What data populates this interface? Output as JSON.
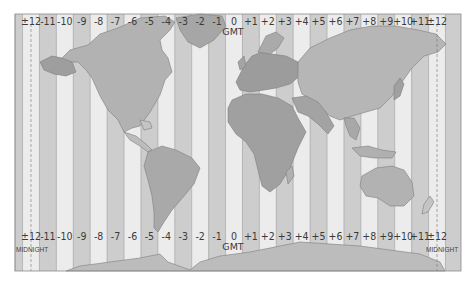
{
  "map": {
    "title": "World Time Zones",
    "zones_top": [
      "±12",
      "-11",
      "-10",
      "-9",
      "-8",
      "-7",
      "-6",
      "-5",
      "-4",
      "-3",
      "-2",
      "-1",
      "0",
      "+1",
      "+2",
      "+3",
      "+4",
      "+5",
      "+6",
      "+7",
      "+8",
      "+9",
      "+10",
      "+11",
      "±12"
    ],
    "zones_bottom": [
      "±12",
      "-11",
      "-10",
      "-9",
      "-8",
      "-7",
      "-6",
      "-5",
      "-4",
      "-3",
      "-2",
      "-1",
      "0",
      "+1",
      "+2",
      "+3",
      "+4",
      "+5",
      "+6",
      "+7",
      "+8",
      "+9",
      "+10",
      "+11",
      "±12"
    ],
    "gmt_label_top": "GMT",
    "gmt_label_bottom": "GMT",
    "midnight_left": "MIDNIGHT",
    "midnight_right": "MIDNIGHT",
    "colors": {
      "ocean_light": "#ececec",
      "ocean_dark": "#cdcdcd",
      "land_light": "#bdbdbd",
      "land_mid": "#a9a9a9",
      "land_dark": "#969696",
      "border": "#7d7d7d",
      "frame": "#8a8a8a"
    }
  }
}
